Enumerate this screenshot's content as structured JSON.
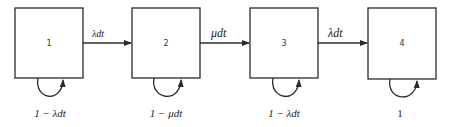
{
  "diagram": {
    "type": "state-transition",
    "states": [
      {
        "id": "1",
        "label": "1",
        "self_loop": "1 − λdt"
      },
      {
        "id": "2",
        "label": "2",
        "self_loop": "1 − μdt"
      },
      {
        "id": "3",
        "label": "3",
        "self_loop": "1 − λdt"
      },
      {
        "id": "4",
        "label": "4",
        "self_loop": "1"
      }
    ],
    "transitions": [
      {
        "from": "1",
        "to": "2",
        "label": "λdt"
      },
      {
        "from": "2",
        "to": "3",
        "label": "μdt"
      },
      {
        "from": "3",
        "to": "4",
        "label": "λdt"
      }
    ]
  }
}
